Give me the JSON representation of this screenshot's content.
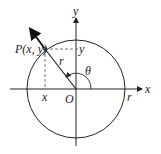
{
  "diagram": {
    "type": "unit-circle-angle",
    "labels": {
      "point": "P(x, y)",
      "x_axis": "x",
      "y_axis": "y",
      "origin": "O",
      "angle": "θ",
      "radius_segment": "r",
      "radius_axis": "r",
      "x_projection": "x",
      "y_projection": "y"
    },
    "colors": {
      "stroke": "#222222",
      "dashed": "#555555",
      "point": "#444444"
    }
  }
}
